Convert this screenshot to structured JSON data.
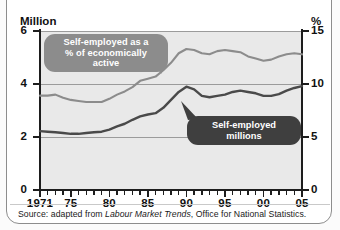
{
  "figure": {
    "left_axis_title": "Million",
    "right_axis_title": "%",
    "source_prefix": "Source: adapted from ",
    "source_italic": "Labour Market Trends",
    "source_suffix": ", Office for National Statistics."
  },
  "callouts": {
    "percent_line1": "Self-employed as a",
    "percent_line2": "% of economically active",
    "millions": "Self-employed millions"
  },
  "colors": {
    "plot_background": "#e9e9e9",
    "percent_series": "#8c8c8c",
    "millions_series": "#4a4a4a",
    "axis": "#1d1d1d",
    "gridline": "#9b9b9b"
  },
  "chart_data": {
    "type": "line",
    "title": "",
    "subtitle": "",
    "xlabel": "",
    "ylabel": "Million",
    "y2label": "%",
    "xlim": [
      1971,
      2005
    ],
    "ylim": [
      0,
      6
    ],
    "y2lim": [
      0,
      15
    ],
    "yticks": [
      0,
      2,
      4,
      6
    ],
    "y2ticks": [
      0,
      5,
      10,
      15
    ],
    "gridlines": [
      2,
      4,
      6
    ],
    "grid": true,
    "legend": "callout-labels",
    "xticks": [
      1971,
      1975,
      1980,
      1985,
      1990,
      1995,
      2000,
      2005
    ],
    "xtick_labels": [
      "1971",
      "75",
      "80",
      "85",
      "90",
      "95",
      "00",
      "05"
    ],
    "x": [
      1971,
      1972,
      1973,
      1974,
      1975,
      1976,
      1977,
      1978,
      1979,
      1980,
      1981,
      1982,
      1983,
      1984,
      1985,
      1986,
      1987,
      1988,
      1989,
      1990,
      1991,
      1992,
      1993,
      1994,
      1995,
      1996,
      1997,
      1998,
      1999,
      2000,
      2001,
      2002,
      2003,
      2004,
      2005
    ],
    "series": [
      {
        "name": "Self-employed as a % of economically active",
        "axis": "right",
        "units": "%",
        "color": "#8c8c8c",
        "values": [
          8.9,
          8.9,
          9.0,
          8.7,
          8.5,
          8.4,
          8.3,
          8.3,
          8.3,
          8.6,
          9.0,
          9.3,
          9.7,
          10.3,
          10.5,
          10.7,
          11.3,
          12.0,
          12.9,
          13.3,
          13.2,
          12.9,
          12.8,
          13.1,
          13.2,
          13.1,
          13.0,
          12.6,
          12.4,
          12.2,
          12.3,
          12.6,
          12.8,
          12.9,
          12.8
        ]
      },
      {
        "name": "Self-employed millions",
        "axis": "left",
        "units": "million",
        "color": "#4a4a4a",
        "values": [
          2.22,
          2.2,
          2.18,
          2.15,
          2.12,
          2.12,
          2.15,
          2.18,
          2.2,
          2.28,
          2.4,
          2.5,
          2.65,
          2.78,
          2.85,
          2.9,
          3.1,
          3.4,
          3.7,
          3.9,
          3.8,
          3.55,
          3.5,
          3.55,
          3.6,
          3.7,
          3.75,
          3.7,
          3.65,
          3.55,
          3.55,
          3.62,
          3.75,
          3.85,
          3.92
        ]
      }
    ]
  }
}
